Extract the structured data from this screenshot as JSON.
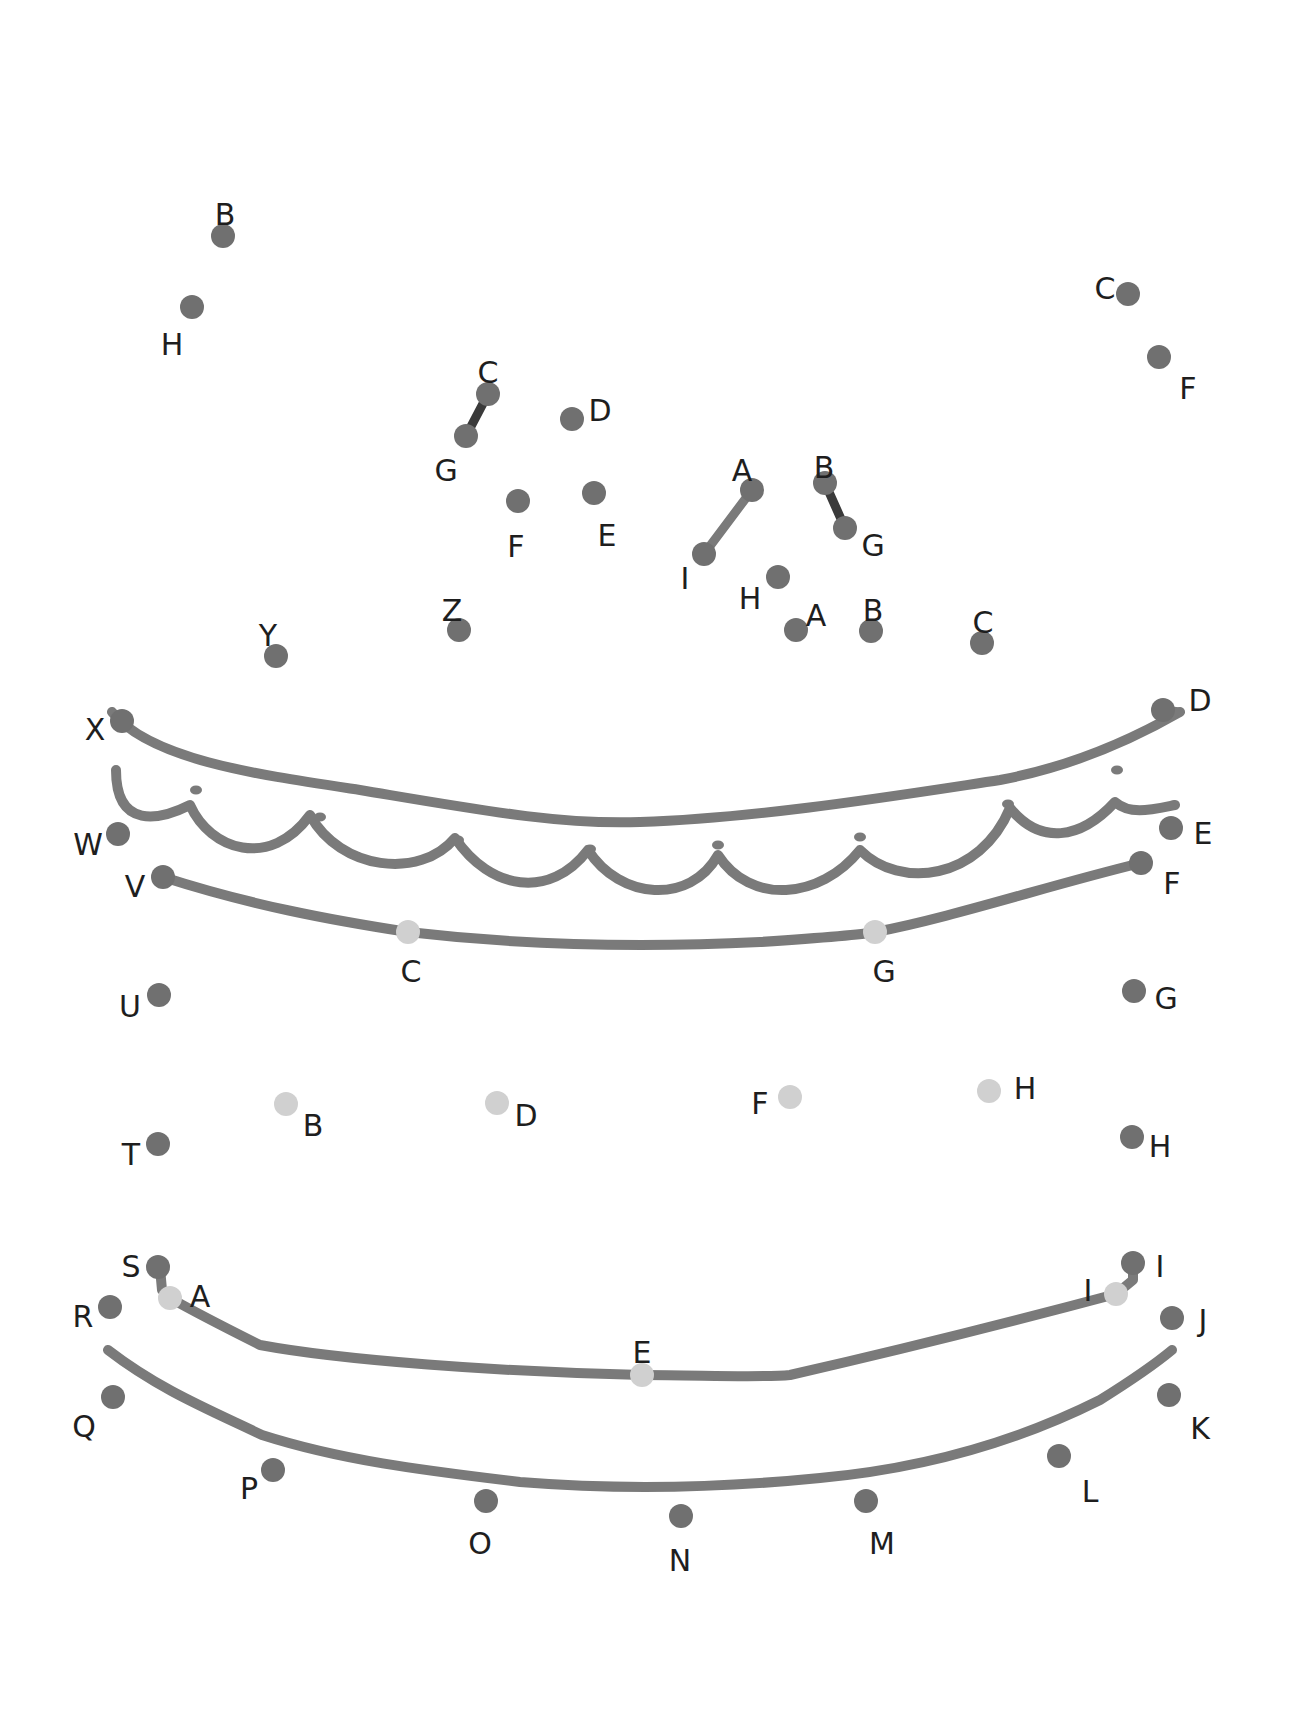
{
  "page": {
    "width": 1307,
    "height": 1717
  },
  "colors": {
    "background": "#ffffff",
    "line": "#7a7a7a",
    "dot_dark": "#707070",
    "dot_light": "#d0d0d0",
    "connector_dark": "#3a3a3a",
    "label": "#1e1e1e"
  },
  "dots": [
    {
      "label": "B",
      "x": 223,
      "y": 236,
      "lx": 225,
      "ly": 216,
      "shade": "dark",
      "group": "hat-top-left"
    },
    {
      "label": "H",
      "x": 192,
      "y": 307,
      "lx": 172,
      "ly": 346,
      "shade": "dark",
      "group": "hat-top-left"
    },
    {
      "label": "C",
      "x": 488,
      "y": 394,
      "lx": 488,
      "ly": 374,
      "shade": "dark",
      "group": "candle-left"
    },
    {
      "label": "G",
      "x": 466,
      "y": 436,
      "lx": 446,
      "ly": 472,
      "shade": "dark",
      "group": "candle-left"
    },
    {
      "label": "D",
      "x": 572,
      "y": 419,
      "lx": 600,
      "ly": 412,
      "shade": "dark",
      "group": "candle-left"
    },
    {
      "label": "E",
      "x": 594,
      "y": 493,
      "lx": 607,
      "ly": 537,
      "shade": "dark",
      "group": "candle-left"
    },
    {
      "label": "F",
      "x": 518,
      "y": 501,
      "lx": 516,
      "ly": 548,
      "shade": "dark",
      "group": "candle-left"
    },
    {
      "label": "A",
      "x": 752,
      "y": 490,
      "lx": 742,
      "ly": 472,
      "shade": "dark",
      "group": "candle-right"
    },
    {
      "label": "I",
      "x": 704,
      "y": 554,
      "lx": 685,
      "ly": 580,
      "shade": "dark",
      "group": "candle-right"
    },
    {
      "label": "B",
      "x": 825,
      "y": 483,
      "lx": 824,
      "ly": 469,
      "shade": "dark",
      "group": "candle-right"
    },
    {
      "label": "G",
      "x": 845,
      "y": 528,
      "lx": 873,
      "ly": 547,
      "shade": "dark",
      "group": "candle-right"
    },
    {
      "label": "H",
      "x": 778,
      "y": 577,
      "lx": 750,
      "ly": 600,
      "shade": "dark",
      "group": "candle-right"
    },
    {
      "label": "A",
      "x": 796,
      "y": 630,
      "lx": 816,
      "ly": 617,
      "shade": "dark",
      "group": "candle-right"
    },
    {
      "label": "B",
      "x": 871,
      "y": 631,
      "lx": 873,
      "ly": 612,
      "shade": "dark",
      "group": "candle-right"
    },
    {
      "label": "C",
      "x": 982,
      "y": 643,
      "lx": 983,
      "ly": 624,
      "shade": "dark",
      "group": "candle-right"
    },
    {
      "label": "C",
      "x": 1128,
      "y": 294,
      "lx": 1105,
      "ly": 290,
      "shade": "dark",
      "group": "hat-top-right"
    },
    {
      "label": "F",
      "x": 1159,
      "y": 357,
      "lx": 1188,
      "ly": 390,
      "shade": "dark",
      "group": "hat-top-right"
    },
    {
      "label": "X",
      "x": 122,
      "y": 721,
      "lx": 95,
      "ly": 731,
      "shade": "dark",
      "group": "outline"
    },
    {
      "label": "Y",
      "x": 276,
      "y": 656,
      "lx": 268,
      "ly": 637,
      "shade": "dark",
      "group": "outline"
    },
    {
      "label": "Z",
      "x": 459,
      "y": 630,
      "lx": 452,
      "ly": 612,
      "shade": "dark",
      "group": "outline"
    },
    {
      "label": "D",
      "x": 1163,
      "y": 710,
      "lx": 1200,
      "ly": 702,
      "shade": "dark",
      "group": "outline"
    },
    {
      "label": "E",
      "x": 1171,
      "y": 828,
      "lx": 1203,
      "ly": 835,
      "shade": "dark",
      "group": "outline"
    },
    {
      "label": "F",
      "x": 1141,
      "y": 863,
      "lx": 1172,
      "ly": 885,
      "shade": "dark",
      "group": "outline"
    },
    {
      "label": "G",
      "x": 1134,
      "y": 991,
      "lx": 1166,
      "ly": 1000,
      "shade": "dark",
      "group": "outline"
    },
    {
      "label": "H",
      "x": 1132,
      "y": 1137,
      "lx": 1160,
      "ly": 1148,
      "shade": "dark",
      "group": "outline"
    },
    {
      "label": "I",
      "x": 1133,
      "y": 1263,
      "lx": 1160,
      "ly": 1268,
      "shade": "dark",
      "group": "outline"
    },
    {
      "label": "J",
      "x": 1172,
      "y": 1318,
      "lx": 1203,
      "ly": 1322,
      "shade": "dark",
      "group": "outline"
    },
    {
      "label": "K",
      "x": 1169,
      "y": 1395,
      "lx": 1200,
      "ly": 1430,
      "shade": "dark",
      "group": "outline"
    },
    {
      "label": "L",
      "x": 1059,
      "y": 1456,
      "lx": 1090,
      "ly": 1493,
      "shade": "dark",
      "group": "outline"
    },
    {
      "label": "M",
      "x": 866,
      "y": 1501,
      "lx": 882,
      "ly": 1545,
      "shade": "dark",
      "group": "outline"
    },
    {
      "label": "N",
      "x": 681,
      "y": 1516,
      "lx": 680,
      "ly": 1562,
      "shade": "dark",
      "group": "outline"
    },
    {
      "label": "O",
      "x": 486,
      "y": 1501,
      "lx": 480,
      "ly": 1545,
      "shade": "dark",
      "group": "outline"
    },
    {
      "label": "P",
      "x": 273,
      "y": 1470,
      "lx": 249,
      "ly": 1490,
      "shade": "dark",
      "group": "outline"
    },
    {
      "label": "Q",
      "x": 113,
      "y": 1397,
      "lx": 84,
      "ly": 1428,
      "shade": "dark",
      "group": "outline"
    },
    {
      "label": "R",
      "x": 110,
      "y": 1307,
      "lx": 83,
      "ly": 1318,
      "shade": "dark",
      "group": "outline"
    },
    {
      "label": "S",
      "x": 158,
      "y": 1267,
      "lx": 131,
      "ly": 1268,
      "shade": "dark",
      "group": "outline"
    },
    {
      "label": "T",
      "x": 158,
      "y": 1144,
      "lx": 131,
      "ly": 1156,
      "shade": "dark",
      "group": "outline"
    },
    {
      "label": "U",
      "x": 159,
      "y": 995,
      "lx": 130,
      "ly": 1008,
      "shade": "dark",
      "group": "outline"
    },
    {
      "label": "V",
      "x": 163,
      "y": 877,
      "lx": 135,
      "ly": 888,
      "shade": "dark",
      "group": "outline"
    },
    {
      "label": "W",
      "x": 118,
      "y": 834,
      "lx": 88,
      "ly": 846,
      "shade": "dark",
      "group": "outline"
    },
    {
      "label": "C",
      "x": 408,
      "y": 932,
      "lx": 411,
      "ly": 973,
      "shade": "light",
      "group": "inner"
    },
    {
      "label": "G",
      "x": 875,
      "y": 932,
      "lx": 884,
      "ly": 973,
      "shade": "light",
      "group": "inner"
    },
    {
      "label": "B",
      "x": 286,
      "y": 1104,
      "lx": 313,
      "ly": 1127,
      "shade": "light",
      "group": "inner"
    },
    {
      "label": "D",
      "x": 497,
      "y": 1103,
      "lx": 526,
      "ly": 1117,
      "shade": "light",
      "group": "inner"
    },
    {
      "label": "F",
      "x": 790,
      "y": 1097,
      "lx": 760,
      "ly": 1105,
      "shade": "light",
      "group": "inner"
    },
    {
      "label": "H",
      "x": 989,
      "y": 1091,
      "lx": 1025,
      "ly": 1090,
      "shade": "light",
      "group": "inner"
    },
    {
      "label": "A",
      "x": 170,
      "y": 1298,
      "lx": 200,
      "ly": 1298,
      "shade": "light",
      "group": "inner"
    },
    {
      "label": "E",
      "x": 642,
      "y": 1375,
      "lx": 642,
      "ly": 1354,
      "shade": "light",
      "group": "inner"
    },
    {
      "label": "I",
      "x": 1116,
      "y": 1294,
      "lx": 1088,
      "ly": 1292,
      "shade": "light",
      "group": "inner"
    }
  ],
  "strokes": [
    {
      "name": "top-rim-line",
      "d": "M112,712 C150,760 260,775 360,790 C480,810 560,825 640,822 C760,818 900,795 1000,780 C1080,765 1140,735 1180,712"
    },
    {
      "name": "scallop-line",
      "d": "M116,770 C116,830 160,820 190,805 C210,850 270,870 310,815 C340,870 420,880 455,838 C490,890 550,900 588,850 C620,900 690,905 718,855 C750,905 820,900 860,850 C900,890 980,880 1010,808 C1040,845 1080,840 1115,802 C1130,815 1150,810 1175,805"
    },
    {
      "name": "upper-band-line",
      "d": "M163,877 C250,905 330,920 408,932 C520,945 640,948 760,942 C820,938 860,935 875,932 C950,918 1050,885 1141,863"
    },
    {
      "name": "lower-band-upper-line",
      "d": "M160,1268 L162,1290 L170,1298 C200,1315 230,1330 260,1345 C340,1360 500,1372 642,1375 C700,1375 760,1378 790,1375 C900,1350 1000,1325 1116,1294 L1133,1280 L1133,1263"
    },
    {
      "name": "lower-band-lower-line",
      "d": "M108,1350 C160,1390 210,1410 262,1435 C340,1460 420,1470 520,1482 C620,1490 720,1488 820,1478 C930,1468 1020,1440 1100,1400 C1140,1375 1160,1360 1172,1350"
    }
  ],
  "scallop_dots": [
    {
      "x": 196,
      "y": 790
    },
    {
      "x": 320,
      "y": 817
    },
    {
      "x": 458,
      "y": 840
    },
    {
      "x": 590,
      "y": 849
    },
    {
      "x": 718,
      "y": 845
    },
    {
      "x": 860,
      "y": 837
    },
    {
      "x": 1008,
      "y": 804
    },
    {
      "x": 1117,
      "y": 770
    }
  ],
  "connectors": [
    {
      "name": "connector-c-g-left",
      "x1": 488,
      "y1": 394,
      "x2": 466,
      "y2": 436,
      "color": "dark"
    },
    {
      "name": "connector-a-i",
      "x1": 752,
      "y1": 490,
      "x2": 704,
      "y2": 554,
      "color": "line"
    },
    {
      "name": "connector-b-g-right",
      "x1": 825,
      "y1": 483,
      "x2": 845,
      "y2": 528,
      "color": "dark"
    },
    {
      "name": "connector-x-top",
      "x1": 112,
      "y1": 712,
      "x2": 122,
      "y2": 721,
      "color": "line"
    },
    {
      "name": "connector-d-top",
      "x1": 1163,
      "y1": 710,
      "x2": 1180,
      "y2": 712,
      "color": "line"
    }
  ]
}
